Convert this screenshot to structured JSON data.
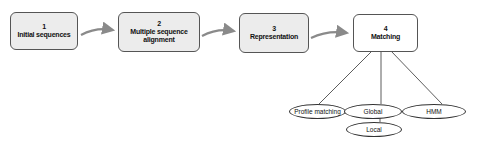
{
  "steps": [
    {
      "number": "1",
      "label": "Initial sequences",
      "style": "filled"
    },
    {
      "number": "2",
      "label": "Multiple sequence alignment",
      "style": "filled"
    },
    {
      "number": "3",
      "label": "Representation",
      "style": "filled"
    },
    {
      "number": "4",
      "label": "Matching",
      "style": "plain"
    }
  ],
  "matching_methods": [
    {
      "label": "Profile matching"
    },
    {
      "label": "Global"
    },
    {
      "label": "HMM"
    }
  ],
  "sub_methods": [
    {
      "label": "Local",
      "parent": "Global"
    }
  ],
  "colors": {
    "box_fill": "#ececec",
    "box_border": "#555555",
    "arrow": "#8a8a8a",
    "line": "#333333"
  }
}
